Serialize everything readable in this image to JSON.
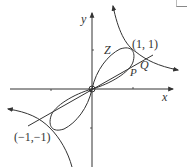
{
  "figure": {
    "axes": {
      "x_label": "x",
      "y_label": "y"
    },
    "points": {
      "upper": "(1, 1)",
      "lower": "(−1,−1)",
      "p": "P",
      "q": "Q",
      "z": "Z"
    },
    "colors": {
      "stroke": "#333333",
      "background": "#ffffff"
    }
  }
}
